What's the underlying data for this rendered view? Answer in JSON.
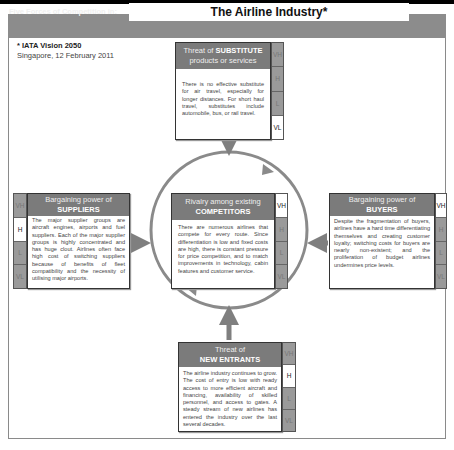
{
  "header": {
    "label": "Five Forces of Competition in:",
    "title": "The Airline Industry*"
  },
  "notes": {
    "source": "* IATA Vision 2050",
    "place_date": "Singapore, 12 February 2011"
  },
  "scale_levels": [
    "VH",
    "H",
    "L",
    "VL"
  ],
  "forces": {
    "substitutes": {
      "title_prefix": "Threat of ",
      "title_bold": "SUBSTITUTE",
      "title_suffix": "products or services",
      "rating": "VL",
      "text": "There is no effective substitute for air travel, especially for longer distances. For short haul travel, substitutes include automobile, bus, or rail travel."
    },
    "suppliers": {
      "title_prefix": "Bargaining power of",
      "title_bold": "SUPPLIERS",
      "rating": "H",
      "text": "The major supplier groups are aircraft engines, airports and fuel suppliers. Each of the major supplier groups is highly concentrated and has huge clout. Airlines often face high cost of switching suppliers because of benefits of fleet compatibility and the necessity of utilising major airports."
    },
    "rivalry": {
      "title_prefix": "Rivalry among existing",
      "title_bold": "COMPETITORS",
      "rating": "VH",
      "text": "There are numerous airlines that compete for every route. Since differentiation is low and fixed costs are high, there is constant pressure for price competition, and to match improvements in technology, cabin features and customer service."
    },
    "buyers": {
      "title_prefix": "Bargaining power of",
      "title_bold": "BUYERS",
      "rating": "VH",
      "text": "Despite the fragmentation of buyers, airlines have a hard time differentiating themselves and creating customer loyalty; switching costs for buyers are nearly non-existent; and the proliferation of budget airlines undermines price levels."
    },
    "new_entrants": {
      "title_prefix": "Threat of",
      "title_bold": "NEW ENTRANTS",
      "rating": "H",
      "text": "The airline industry continues to grow. The cost of entry is low with ready access to more efficient aircraft and financing, availability of skilled personnel, and access to gates. A steady stream of new airlines has entered the industry over the last several decades."
    }
  },
  "colors": {
    "header_bg": "#8c8c8c",
    "box_head_bg": "#7b7b7b",
    "arrow": "#7f7f7f",
    "scale_bg": "#9a9a9a"
  }
}
